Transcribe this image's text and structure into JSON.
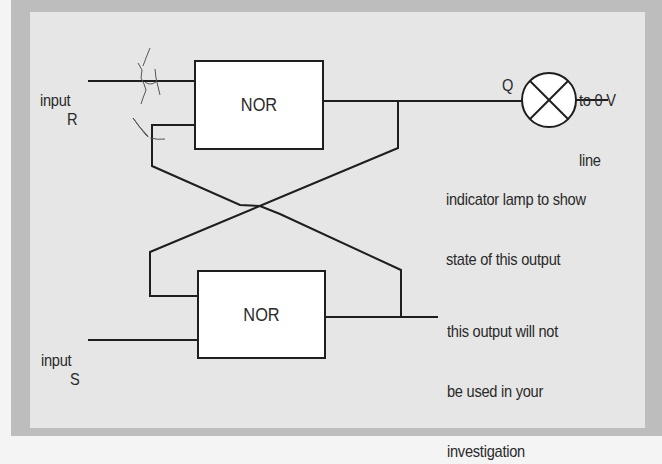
{
  "diagram": {
    "colors": {
      "background_outer": "#f4f4f4",
      "frame": "#bdbdbd",
      "panel": "#e6e6e6",
      "gate_fill": "#ffffff",
      "wire": "#1e1e1e",
      "text": "#2a2a2a"
    },
    "inputs": {
      "r": {
        "label_line1": "input",
        "label_line2": "R"
      },
      "s": {
        "label_line1": "input",
        "label_line2": "S"
      }
    },
    "gates": [
      {
        "id": "top",
        "label": "NOR"
      },
      {
        "id": "bottom",
        "label": "NOR"
      }
    ],
    "output": {
      "q_label": "Q",
      "lamp_icon": "lamp-symbol-icon",
      "lamp_destination_line1": "to 0 V",
      "lamp_destination_line2": "line",
      "lamp_note_line1": "indicator lamp to show",
      "lamp_note_line2": "state of this output",
      "unused_note_line1": "this output will not",
      "unused_note_line2": "be used in your",
      "unused_note_line3": "investigation"
    }
  }
}
